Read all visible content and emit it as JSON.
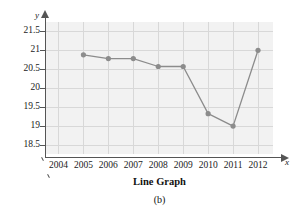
{
  "chart_data": {
    "type": "line",
    "title": "Line Graph",
    "figure_label": "(b)",
    "xlabel": "x",
    "ylabel": "y",
    "grid": true,
    "legend": "none",
    "xlim": [
      2003.5,
      2012.6
    ],
    "ylim": [
      18.25,
      21.75
    ],
    "x_tick_labels": [
      "2004",
      "2005",
      "2006",
      "2007",
      "2008",
      "2009",
      "2010",
      "2011",
      "2012"
    ],
    "x_ticks": [
      2004,
      2005,
      2006,
      2007,
      2008,
      2009,
      2010,
      2011,
      2012
    ],
    "y_tick_labels": [
      "21.5",
      "21",
      "20.5",
      "20",
      "19.5",
      "19",
      "18.5"
    ],
    "y_ticks": [
      21.5,
      21,
      20.5,
      20,
      19.5,
      19,
      18.5
    ],
    "axis_break": true,
    "marker": "circle",
    "series": [
      {
        "name": "series-1",
        "color": "#8c8c8c",
        "x": [
          2005,
          2006,
          2007,
          2008,
          2009,
          2010,
          2011,
          2012
        ],
        "values": [
          20.88,
          20.78,
          20.78,
          20.57,
          20.57,
          19.32,
          18.99,
          21.0
        ]
      }
    ]
  },
  "style": {
    "plot_background": "#f2f2f2",
    "gridline_color": "#d8d8d8",
    "axis_color": "#555555",
    "series_color": "#8c8c8c",
    "text_color": "#1a1a1a"
  }
}
